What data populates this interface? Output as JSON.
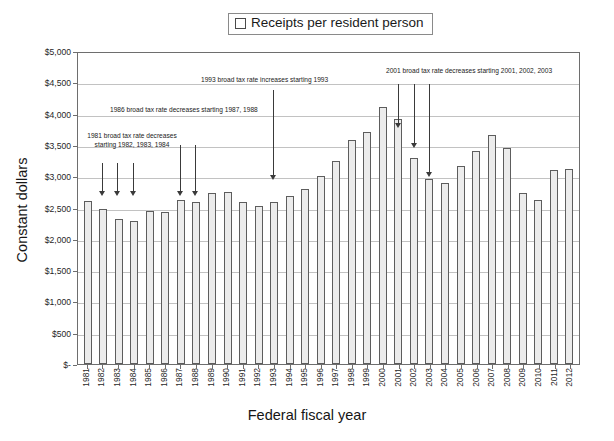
{
  "legend": {
    "swatch_icon": "legend-square-icon",
    "label": "Receipts per resident person"
  },
  "axes": {
    "y_title": "Constant dollars",
    "x_title": "Federal fiscal year",
    "y_ticks": [
      "$5,000",
      "$4,500",
      "$4,000",
      "$3,500",
      "$3,000",
      "$2,500",
      "$2,000",
      "$1,500",
      "$1,000",
      "$500",
      "$-"
    ]
  },
  "annotations": [
    {
      "id": "anno-1981",
      "line1": "1981 broad tax rate decreases",
      "line2": "starting 1982, 1983, 1984",
      "text": "1981 broad tax rate decreases starting 1982, 1983, 1984"
    },
    {
      "id": "anno-1986",
      "text": "1986 broad tax rate decreases starting 1987, 1988"
    },
    {
      "id": "anno-1993",
      "text": "1993 broad tax rate increases starting 1993"
    },
    {
      "id": "anno-2001",
      "text": "2001 broad tax rate decreases starting 2001, 2002, 2003"
    }
  ],
  "chart_data": {
    "type": "bar",
    "title": "Receipts per resident person",
    "xlabel": "Federal fiscal year",
    "ylabel": "Constant dollars",
    "ylim": [
      0,
      5000
    ],
    "ytick_values": [
      5000,
      4500,
      4000,
      3500,
      3000,
      2500,
      2000,
      1500,
      1000,
      500,
      0
    ],
    "grid": true,
    "legend_position": "top-center",
    "series_name": "Receipts per resident person",
    "categories": [
      "1981",
      "1982",
      "1983",
      "1984",
      "1985",
      "1986",
      "1987",
      "1988",
      "1989",
      "1990",
      "1991",
      "1992",
      "1993",
      "1994",
      "1995",
      "1996",
      "1997",
      "1998",
      "1999",
      "2000",
      "2001",
      "2002",
      "2003",
      "2004",
      "2005",
      "2006",
      "2007",
      "2008",
      "2009",
      "2010",
      "2011",
      "2012"
    ],
    "values": [
      2600,
      2480,
      2320,
      2280,
      2440,
      2430,
      2620,
      2590,
      2730,
      2740,
      2590,
      2520,
      2590,
      2680,
      2790,
      3000,
      3250,
      3580,
      3710,
      4100,
      3910,
      3290,
      2950,
      2890,
      3160,
      3410,
      3660,
      3450,
      2730,
      2620,
      3100,
      3120
    ]
  }
}
